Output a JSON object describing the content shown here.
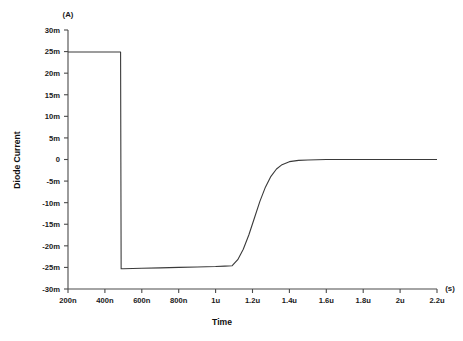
{
  "chart_data": {
    "type": "line",
    "title": "",
    "xlabel": "Time",
    "ylabel": "Diode Current",
    "x_unit_label": "(s)",
    "y_unit_label": "(A)",
    "grid": false,
    "legend": "none",
    "xlim": [
      2e-07,
      2.2e-06
    ],
    "ylim": [
      -0.03,
      0.03
    ],
    "x_ticks": [
      2e-07,
      4e-07,
      6e-07,
      8e-07,
      1e-06,
      1.2e-06,
      1.4e-06,
      1.6e-06,
      1.8e-06,
      2e-06,
      2.2e-06
    ],
    "x_tick_labels": [
      "200n",
      "400n",
      "600n",
      "800n",
      "1u",
      "1.2u",
      "1.4u",
      "1.6u",
      "1.8u",
      "2u",
      "2.2u"
    ],
    "y_ticks": [
      0.03,
      0.025,
      0.02,
      0.015,
      0.01,
      0.005,
      0,
      -0.005,
      -0.01,
      -0.015,
      -0.02,
      -0.025,
      -0.03
    ],
    "y_tick_labels": [
      "30m",
      "25m",
      "20m",
      "15m",
      "10m",
      "5m",
      "0",
      "-5m",
      "-10m",
      "-15m",
      "-20m",
      "-25m",
      "-30m"
    ],
    "series": [
      {
        "name": "Diode Current",
        "color": "#3a3a3a",
        "x": [
          2e-07,
          4e-07,
          4.85e-07,
          4.88e-07,
          5e-07,
          6e-07,
          7e-07,
          8e-07,
          9e-07,
          1e-06,
          1.05e-06,
          1.09e-06,
          1.12e-06,
          1.15e-06,
          1.18e-06,
          1.21e-06,
          1.24e-06,
          1.27e-06,
          1.3e-06,
          1.33e-06,
          1.36e-06,
          1.4e-06,
          1.45e-06,
          1.5e-06,
          1.6e-06,
          1.8e-06,
          2e-06,
          2.2e-06
        ],
        "y": [
          0.0249,
          0.0249,
          0.0249,
          -0.0253,
          -0.0253,
          -0.0252,
          -0.0251,
          -0.025,
          -0.0249,
          -0.0248,
          -0.0247,
          -0.0246,
          -0.0232,
          -0.0208,
          -0.0175,
          -0.0136,
          -0.0097,
          -0.0064,
          -0.0039,
          -0.0022,
          -0.0012,
          -0.0005,
          -0.0002,
          -0.0001,
          0.0,
          0.0,
          0.0,
          0.0
        ]
      }
    ]
  }
}
